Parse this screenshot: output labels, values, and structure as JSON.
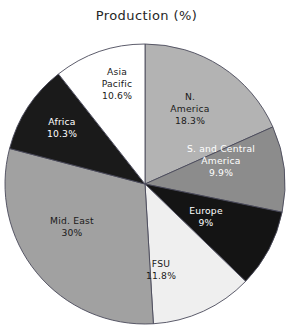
{
  "chart": {
    "title": "Production (%)"
  },
  "chart_data": {
    "type": "pie",
    "title": "Production (%)",
    "xlabel": "",
    "ylabel": "",
    "unit": "%",
    "start_angle_deg": 90,
    "direction": "clockwise",
    "legend": "none (labels drawn inside slices)",
    "grid": false,
    "categories": [
      "N. America",
      "S. and Central America",
      "Europe",
      "FSU",
      "Mid. East",
      "Africa",
      "Asia Pacific"
    ],
    "values": [
      18.3,
      9.9,
      9.0,
      11.8,
      30.0,
      10.3,
      10.6
    ],
    "value_labels": [
      "18.3%",
      "9.9%",
      "9%",
      "11.8%",
      "30%",
      "10.3%",
      "10.6%"
    ],
    "colors": [
      "#b3b3b3",
      "#8c8c8c",
      "#141414",
      "#efefef",
      "#a1a1a1",
      "#1a1a1a",
      "#ffffff"
    ],
    "label_colors": [
      "#1a1a1a",
      "#ffffff",
      "#ffffff",
      "#1a1a1a",
      "#1a1a1a",
      "#ffffff",
      "#1a1a1a"
    ],
    "slices": [
      {
        "name": "N. America",
        "value": 18.3,
        "value_label": "18.3%",
        "label_lines": [
          "N.",
          "America",
          "18.3%"
        ],
        "color": "#b3b3b3",
        "label_color": "#1a1a1a",
        "label_x": 190,
        "label_y": 100
      },
      {
        "name": "S. and Central America",
        "value": 9.9,
        "value_label": "9.9%",
        "label_lines": [
          "S. and Central",
          "America",
          "9.9%"
        ],
        "color": "#8c8c8c",
        "label_color": "#ffffff",
        "label_x": 221,
        "label_y": 152
      },
      {
        "name": "Europe",
        "value": 9.0,
        "value_label": "9%",
        "label_lines": [
          "Europe",
          "9%"
        ],
        "color": "#141414",
        "label_color": "#ffffff",
        "label_x": 206,
        "label_y": 214
      },
      {
        "name": "FSU",
        "value": 11.8,
        "value_label": "11.8%",
        "label_lines": [
          "FSU",
          "11.8%"
        ],
        "color": "#efefef",
        "label_color": "#1a1a1a",
        "label_x": 161,
        "label_y": 267
      },
      {
        "name": "Mid. East",
        "value": 30.0,
        "value_label": "30%",
        "label_lines": [
          "Mid. East",
          "30%"
        ],
        "color": "#a1a1a1",
        "label_color": "#1a1a1a",
        "label_x": 72,
        "label_y": 224
      },
      {
        "name": "Africa",
        "value": 10.3,
        "value_label": "10.3%",
        "label_lines": [
          "Africa",
          "10.3%"
        ],
        "color": "#1a1a1a",
        "label_color": "#ffffff",
        "label_x": 62,
        "label_y": 125
      },
      {
        "name": "Asia Pacific",
        "value": 10.6,
        "value_label": "10.6%",
        "label_lines": [
          "Asia",
          "Pacific",
          "10.6%"
        ],
        "color": "#ffffff",
        "label_color": "#1a1a1a",
        "label_x": 117,
        "label_y": 75
      }
    ],
    "geometry": {
      "center_x": 145,
      "center_y": 184,
      "radius": 140
    }
  }
}
